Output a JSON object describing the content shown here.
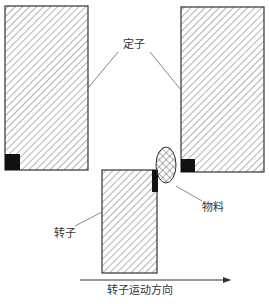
{
  "labels": {
    "stator": "定子",
    "rotor": "转子",
    "material": "物料",
    "direction": "转子运动方向"
  },
  "colors": {
    "stroke": "#333333",
    "hatch": "#555555",
    "block": "#111111",
    "background": "#ffffff"
  }
}
